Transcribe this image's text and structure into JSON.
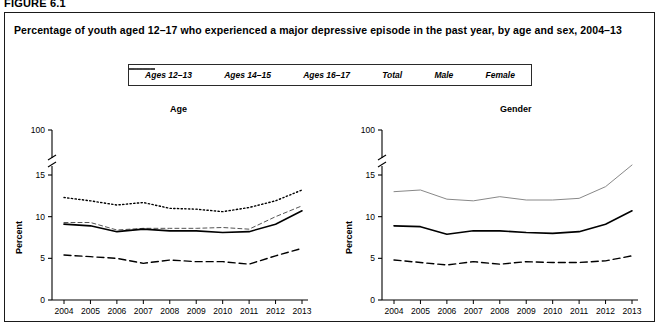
{
  "figure": {
    "label": "FIGURE 6.1",
    "title": "Percentage of youth aged 12–17 who experienced a major depressive episode in the past year, by age and sex, 2004–13"
  },
  "legend": {
    "items": [
      {
        "label": "Ages 12–13",
        "style": "long-dash",
        "color": "#000000"
      },
      {
        "label": "Ages 14–15",
        "style": "dash-dot-fine",
        "color": "#000000"
      },
      {
        "label": "Ages 16–17",
        "style": "dotted",
        "color": "#000000"
      },
      {
        "label": "Total",
        "style": "solid",
        "color": "#000000"
      },
      {
        "label": "Male",
        "style": "dash",
        "color": "#000000"
      },
      {
        "label": "Female",
        "style": "thin-solid",
        "color": "#666666"
      }
    ]
  },
  "panels": [
    {
      "key": "age",
      "title": "Age"
    },
    {
      "key": "gender",
      "title": "Gender"
    }
  ],
  "axis": {
    "y_label": "Percent",
    "y_ticks": [
      "0",
      "5",
      "10",
      "15",
      "100"
    ],
    "y_break_after": "15",
    "x_ticks": [
      "2004",
      "2005",
      "2006",
      "2007",
      "2008",
      "2009",
      "2010",
      "2011",
      "2012",
      "2013"
    ]
  },
  "chart_data": [
    {
      "type": "line",
      "title": "Age",
      "xlabel": "",
      "ylabel": "Percent",
      "ylim": [
        0,
        100
      ],
      "y_ticks": [
        0,
        5,
        10,
        15,
        100
      ],
      "axis_break": true,
      "grid": false,
      "legend_position": "top",
      "x": [
        2004,
        2005,
        2006,
        2007,
        2008,
        2009,
        2010,
        2011,
        2012,
        2013
      ],
      "series": [
        {
          "name": "Ages 12–13",
          "style": "long-dash",
          "values": [
            5.4,
            5.2,
            5.0,
            4.4,
            4.8,
            4.6,
            4.6,
            4.3,
            5.3,
            6.2
          ]
        },
        {
          "name": "Ages 14–15",
          "style": "dash-dot-fine",
          "values": [
            9.3,
            9.3,
            8.4,
            8.6,
            8.6,
            8.6,
            8.7,
            8.5,
            10.0,
            11.3
          ]
        },
        {
          "name": "Ages 16–17",
          "style": "dotted",
          "values": [
            12.3,
            11.9,
            11.4,
            11.7,
            11.0,
            10.9,
            10.6,
            11.1,
            11.9,
            13.2
          ]
        },
        {
          "name": "Total",
          "style": "solid",
          "values": [
            9.1,
            8.9,
            8.2,
            8.5,
            8.3,
            8.3,
            8.1,
            8.2,
            9.1,
            10.7
          ]
        }
      ]
    },
    {
      "type": "line",
      "title": "Gender",
      "xlabel": "",
      "ylabel": "Percent",
      "ylim": [
        0,
        100
      ],
      "y_ticks": [
        0,
        5,
        10,
        15,
        100
      ],
      "axis_break": true,
      "grid": false,
      "legend_position": "top",
      "x": [
        2004,
        2005,
        2006,
        2007,
        2008,
        2009,
        2010,
        2011,
        2012,
        2013
      ],
      "series": [
        {
          "name": "Total",
          "style": "solid",
          "values": [
            8.9,
            8.8,
            7.9,
            8.3,
            8.3,
            8.1,
            8.0,
            8.2,
            9.1,
            10.7
          ]
        },
        {
          "name": "Male",
          "style": "dash",
          "values": [
            4.8,
            4.5,
            4.2,
            4.6,
            4.3,
            4.6,
            4.5,
            4.5,
            4.7,
            5.3
          ]
        },
        {
          "name": "Female",
          "style": "thin-solid",
          "values": [
            13.0,
            13.2,
            12.1,
            11.9,
            12.4,
            12.0,
            12.0,
            12.2,
            13.6,
            16.2
          ]
        }
      ]
    }
  ]
}
